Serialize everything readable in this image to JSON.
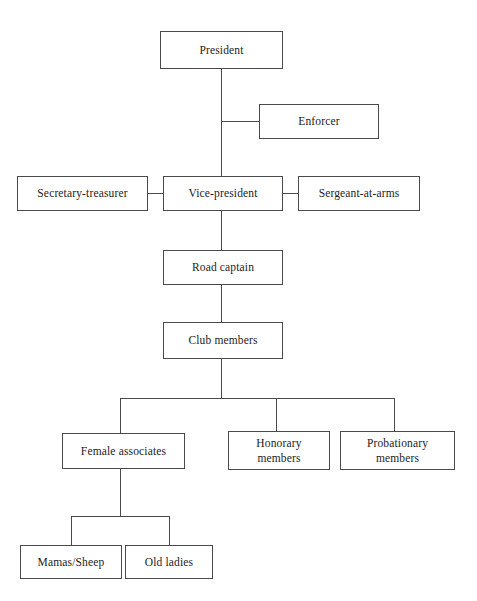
{
  "diagram": {
    "type": "organizational-chart",
    "background_color": "#ffffff",
    "line_color": "#4a4a4a",
    "text_color": "#1c1c1c",
    "nodes": [
      {
        "id": "president",
        "label": "President",
        "level": 1,
        "x": 160,
        "y": 31,
        "width": 123,
        "height": 38
      },
      {
        "id": "enforcer",
        "label": "Enforcer",
        "level": 2,
        "x": 259,
        "y": 104,
        "width": 120,
        "height": 35
      },
      {
        "id": "secretary-treasurer",
        "label": "Secretary-treasurer",
        "level": 3,
        "x": 17,
        "y": 176,
        "width": 131,
        "height": 35
      },
      {
        "id": "vice-president",
        "label": "Vice-president",
        "level": 3,
        "x": 163,
        "y": 176,
        "width": 120,
        "height": 35
      },
      {
        "id": "sergeant-at-arms",
        "label": "Sergeant-at-arms",
        "level": 3,
        "x": 298,
        "y": 176,
        "width": 122,
        "height": 35
      },
      {
        "id": "road-captain",
        "label": "Road captain",
        "level": 4,
        "x": 163,
        "y": 250,
        "width": 120,
        "height": 35
      },
      {
        "id": "club-members",
        "label": "Club members",
        "level": 5,
        "x": 163,
        "y": 322,
        "width": 120,
        "height": 37
      },
      {
        "id": "female-associates",
        "label": "Female associates",
        "level": 6,
        "x": 62,
        "y": 433,
        "width": 123,
        "height": 36
      },
      {
        "id": "honorary-members",
        "label": "Honorary\nmembers",
        "level": 6,
        "x": 228,
        "y": 431,
        "width": 102,
        "height": 39
      },
      {
        "id": "probationary-members",
        "label": "Probationary\nmembers",
        "level": 6,
        "x": 340,
        "y": 431,
        "width": 115,
        "height": 39
      },
      {
        "id": "mamas-sheep",
        "label": "Mamas/Sheep",
        "level": 7,
        "x": 20,
        "y": 545,
        "width": 102,
        "height": 34
      },
      {
        "id": "old-ladies",
        "label": "Old ladies",
        "level": 7,
        "x": 125,
        "y": 545,
        "width": 88,
        "height": 34
      }
    ],
    "edges": [
      {
        "from": "president",
        "to": "enforcer",
        "style": "elbow"
      },
      {
        "from": "president",
        "to": "vice-president",
        "style": "vertical"
      },
      {
        "from": "vice-president",
        "to": "secretary-treasurer",
        "style": "horizontal"
      },
      {
        "from": "vice-president",
        "to": "sergeant-at-arms",
        "style": "horizontal"
      },
      {
        "from": "vice-president",
        "to": "road-captain",
        "style": "vertical"
      },
      {
        "from": "road-captain",
        "to": "club-members",
        "style": "vertical"
      },
      {
        "from": "club-members",
        "to": "female-associates",
        "style": "bus"
      },
      {
        "from": "club-members",
        "to": "honorary-members",
        "style": "bus"
      },
      {
        "from": "club-members",
        "to": "probationary-members",
        "style": "bus"
      },
      {
        "from": "female-associates",
        "to": "mamas-sheep",
        "style": "bus"
      },
      {
        "from": "female-associates",
        "to": "old-ladies",
        "style": "bus"
      }
    ]
  }
}
